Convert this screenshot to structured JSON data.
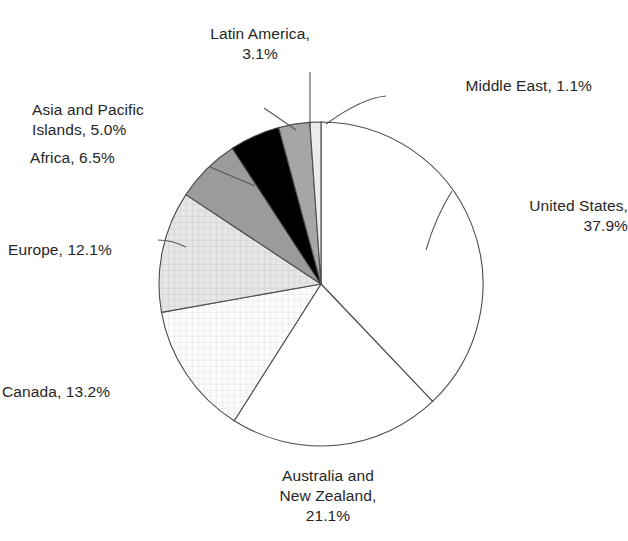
{
  "chart_data": {
    "type": "pie",
    "title": "",
    "subtitle": "",
    "xlabel": "",
    "ylabel": "",
    "grid": false,
    "legend_position": "none",
    "label_format": "{name}, {value}%",
    "start_angle_deg": 0,
    "direction": "clockwise",
    "units": "percent",
    "total": 100.0,
    "categories": [
      "United States",
      "Australia and New Zealand",
      "Canada",
      "Europe",
      "Africa",
      "Asia and Pacific Islands",
      "Latin America",
      "Middle East"
    ],
    "values": [
      37.9,
      21.1,
      13.2,
      12.1,
      6.5,
      5.0,
      3.1,
      1.1
    ],
    "slices": [
      {
        "name": "United States",
        "value": 37.9,
        "label": "United States,\n37.9%",
        "label_lines": [
          "United States,",
          "37.9%"
        ],
        "fill": "#ffffff",
        "stroke": "#4d4d4d",
        "pattern": "none",
        "start_deg": 0.0,
        "end_deg": 136.44
      },
      {
        "name": "Australia and New Zealand",
        "value": 21.1,
        "label": "Australia and\nNew Zealand,\n21.1%",
        "label_lines": [
          "Australia and",
          "New Zealand,",
          "21.1%"
        ],
        "fill": "#ffffff",
        "stroke": "#4d4d4d",
        "pattern": "none",
        "start_deg": 136.44,
        "end_deg": 212.4
      },
      {
        "name": "Canada",
        "value": 13.2,
        "label": "Canada, 13.2%",
        "label_lines": [
          "Canada, 13.2%"
        ],
        "fill": "#fbfbfb",
        "stroke": "#4d4d4d",
        "pattern": "fine-grid",
        "start_deg": 212.4,
        "end_deg": 259.92
      },
      {
        "name": "Europe",
        "value": 12.1,
        "label": "Europe, 12.1%",
        "label_lines": [
          "Europe, 12.1%"
        ],
        "fill": "#e3e3e3",
        "stroke": "#4d4d4d",
        "pattern": "fine-grid",
        "start_deg": 259.92,
        "end_deg": 303.48
      },
      {
        "name": "Africa",
        "value": 6.5,
        "label": "Africa, 6.5%",
        "label_lines": [
          "Africa, 6.5%"
        ],
        "fill": "#9b9b9b",
        "stroke": "#4d4d4d",
        "pattern": "none",
        "start_deg": 303.48,
        "end_deg": 326.88
      },
      {
        "name": "Asia and Pacific Islands",
        "value": 5.0,
        "label": "Asia and Pacific\nIslands, 5.0%",
        "label_lines": [
          "Asia and Pacific",
          "Islands, 5.0%"
        ],
        "fill": "#000000",
        "stroke": "#333333",
        "pattern": "none",
        "start_deg": 326.88,
        "end_deg": 344.88
      },
      {
        "name": "Latin America",
        "value": 3.1,
        "label": "Latin America,\n3.1%",
        "label_lines": [
          "Latin America,",
          "3.1%"
        ],
        "fill": "#a6a6a6",
        "stroke": "#4d4d4d",
        "pattern": "none",
        "start_deg": 344.88,
        "end_deg": 356.04
      },
      {
        "name": "Middle East",
        "value": 1.1,
        "label": "Middle East, 1.1%",
        "label_lines": [
          "Middle East, 1.1%"
        ],
        "fill": "#ebebeb",
        "stroke": "#4d4d4d",
        "pattern": "none",
        "start_deg": 356.04,
        "end_deg": 360.0
      }
    ]
  },
  "geometry": {
    "center_x": 321,
    "center_y": 284,
    "radius": 162
  },
  "colors": {
    "background": "#ffffff",
    "outline": "#4d4d4d",
    "leader_line": "#555555",
    "text": "#262626"
  }
}
